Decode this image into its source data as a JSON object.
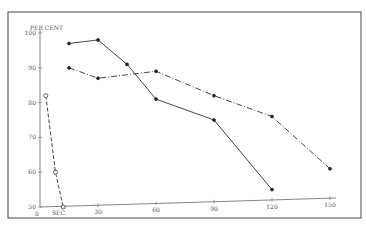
{
  "chart_data": {
    "type": "line",
    "title": "",
    "xlabel": "SEC.",
    "ylabel": "PER CENT",
    "xlim": [
      0,
      150
    ],
    "ylim": [
      50,
      100
    ],
    "x_ticks": [
      "0",
      "30",
      "60",
      "90",
      "120",
      "150"
    ],
    "y_ticks": [
      "100",
      "90",
      "80",
      "70",
      "60",
      "50"
    ],
    "grid": false,
    "legend": null,
    "series": [
      {
        "name": "solid line, filled markers",
        "style": "solid",
        "x": [
          15,
          30,
          45,
          60,
          90,
          120
        ],
        "y": [
          97,
          98,
          91,
          81,
          75,
          55
        ]
      },
      {
        "name": "dash-dot line, filled markers",
        "style": "dash-dot",
        "x": [
          15,
          30,
          60,
          90,
          120,
          150
        ],
        "y": [
          90,
          87,
          89,
          82,
          76,
          61
        ]
      },
      {
        "name": "dashed line, open circles",
        "style": "dashed",
        "x": [
          3,
          8,
          12
        ],
        "y": [
          82,
          60,
          50
        ]
      }
    ]
  },
  "axes": {
    "y_unit_label": "PER CENT",
    "x_unit_label": "SEC.",
    "x_zero_label": "0"
  }
}
